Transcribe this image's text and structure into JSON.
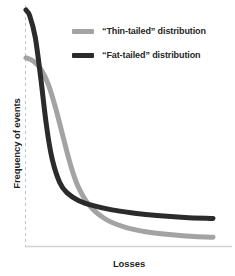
{
  "chart_data": {
    "type": "line",
    "title": "",
    "subtitle": "",
    "xlabel": "Losses",
    "ylabel": "Frequency of events",
    "xlim": [
      0,
      1
    ],
    "ylim": [
      0,
      1
    ],
    "grid": false,
    "axis_ticks": {
      "x": [],
      "y": []
    },
    "legend_position": "top-right",
    "annotations": [],
    "series": [
      {
        "name": "“Thin-tailed” distribution",
        "color": "#a3a3a3",
        "linewidth": 5,
        "description": "Steeply decaying curve that starts lower and falls to a near-zero tail",
        "x": [
          0.0,
          0.04,
          0.08,
          0.12,
          0.16,
          0.2,
          0.24,
          0.28,
          0.34,
          0.42,
          0.52,
          0.64,
          0.78,
          0.9,
          1.0
        ],
        "y": [
          0.795,
          0.78,
          0.745,
          0.68,
          0.575,
          0.45,
          0.33,
          0.24,
          0.16,
          0.105,
          0.07,
          0.048,
          0.035,
          0.028,
          0.025
        ]
      },
      {
        "name": "“Fat-tailed” distribution",
        "color": "#2b2b2b",
        "linewidth": 5,
        "description": "Very steep initial drop followed by a long, slowly decaying heavy tail",
        "x": [
          0.0,
          0.02,
          0.05,
          0.08,
          0.11,
          0.14,
          0.18,
          0.22,
          0.28,
          0.36,
          0.46,
          0.58,
          0.7,
          0.85,
          1.0
        ],
        "y": [
          1.0,
          0.975,
          0.88,
          0.7,
          0.5,
          0.36,
          0.26,
          0.215,
          0.183,
          0.16,
          0.142,
          0.128,
          0.118,
          0.11,
          0.105
        ]
      }
    ],
    "crossing_point": {
      "x": 0.24,
      "y": 0.205
    }
  },
  "legend": {
    "items": [
      {
        "label": "“Thin-tailed” distribution",
        "color": "#a3a3a3"
      },
      {
        "label": "“Fat-tailed” distribution",
        "color": "#2b2b2b"
      }
    ]
  },
  "axes": {
    "x_title": "Losses",
    "y_title": "Frequency of events",
    "x_axis_color": "#d2d2d2",
    "y_axis_color": "#c4c4c4",
    "y_axis_style": "dashed"
  }
}
